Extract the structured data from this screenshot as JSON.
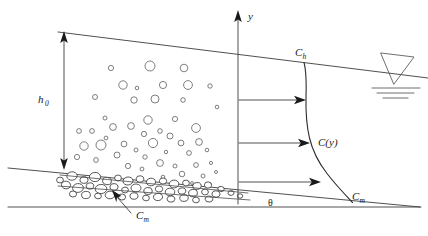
{
  "figure": {
    "kind": "schematic-diagram",
    "background_color": "#ffffff",
    "line_color": "#3c3c3c",
    "label_color": "#1a1a1a"
  },
  "labels": {
    "y_axis": "y",
    "flow_depth": "h",
    "flow_depth_sub": "0",
    "surface_concentration": "C",
    "surface_concentration_sub": "h",
    "profile": "C(y)",
    "max_concentration": "C",
    "max_concentration_sub": "m",
    "bed_concentration": "C",
    "bed_concentration_sub": "m",
    "slope_angle": "θ"
  },
  "geometry": {
    "water_surface": {
      "x1": 58,
      "y1": 32,
      "x2": 428,
      "y2": 78
    },
    "bed_line": {
      "x1": 8,
      "y1": 168,
      "x2": 420,
      "y2": 207
    },
    "datum_line": {
      "x1": 8,
      "y1": 207,
      "x2": 421,
      "y2": 207
    },
    "y_axis": {
      "x": 238,
      "y_top": 12,
      "y_bottom": 204
    },
    "depth_dimension": {
      "x": 64,
      "y_top": 33,
      "y_bottom": 168
    },
    "profile_curve_top_x": 305,
    "profile_curve_bottom_x": 352
  },
  "flux_arrows": [
    {
      "y": 100,
      "x_start": 239,
      "x_end": 305
    },
    {
      "y": 143,
      "x_start": 239,
      "x_end": 309
    },
    {
      "y": 182,
      "x_start": 239,
      "x_end": 320
    }
  ],
  "annotation_pointer": {
    "from_x": 130,
    "from_y": 212,
    "to_x": 113,
    "to_y": 193
  },
  "free_surface_symbol": {
    "triangle": [
      [
        381,
        53
      ],
      [
        414,
        57
      ],
      [
        394,
        84
      ]
    ],
    "lines": [
      {
        "x1": 372,
        "y1": 88,
        "x2": 420,
        "y2": 88
      },
      {
        "x1": 377,
        "y1": 93,
        "x2": 414,
        "y2": 93
      },
      {
        "x1": 383,
        "y1": 98,
        "x2": 408,
        "y2": 98
      }
    ]
  },
  "suspended_particles": [
    {
      "cx": 111,
      "cy": 68,
      "r": 2.6
    },
    {
      "cx": 150,
      "cy": 66,
      "r": 5.0
    },
    {
      "cx": 184,
      "cy": 68,
      "r": 3.8
    },
    {
      "cx": 123,
      "cy": 85,
      "r": 4.2
    },
    {
      "cx": 137,
      "cy": 88,
      "r": 1.8
    },
    {
      "cx": 163,
      "cy": 85,
      "r": 3.6
    },
    {
      "cx": 188,
      "cy": 85,
      "r": 4.4
    },
    {
      "cx": 210,
      "cy": 86,
      "r": 2.2
    },
    {
      "cx": 95,
      "cy": 97,
      "r": 2.5
    },
    {
      "cx": 134,
      "cy": 100,
      "r": 3.2
    },
    {
      "cx": 155,
      "cy": 99,
      "r": 4.0
    },
    {
      "cx": 183,
      "cy": 100,
      "r": 2.3
    },
    {
      "cx": 217,
      "cy": 107,
      "r": 1.8
    },
    {
      "cx": 105,
      "cy": 118,
      "r": 2.0
    },
    {
      "cx": 148,
      "cy": 120,
      "r": 4.2
    },
    {
      "cx": 175,
      "cy": 119,
      "r": 2.6
    },
    {
      "cx": 79,
      "cy": 131,
      "r": 2.4
    },
    {
      "cx": 92,
      "cy": 131,
      "r": 2.4
    },
    {
      "cx": 113,
      "cy": 127,
      "r": 3.4
    },
    {
      "cx": 131,
      "cy": 126,
      "r": 3.4
    },
    {
      "cx": 160,
      "cy": 131,
      "r": 2.3
    },
    {
      "cx": 196,
      "cy": 128,
      "r": 4.4
    },
    {
      "cx": 106,
      "cy": 138,
      "r": 1.9
    },
    {
      "cx": 144,
      "cy": 134,
      "r": 2.6
    },
    {
      "cx": 170,
      "cy": 136,
      "r": 3.0
    },
    {
      "cx": 84,
      "cy": 146,
      "r": 4.2
    },
    {
      "cx": 101,
      "cy": 145,
      "r": 5.0
    },
    {
      "cx": 124,
      "cy": 144,
      "r": 2.9
    },
    {
      "cx": 153,
      "cy": 143,
      "r": 4.6
    },
    {
      "cx": 181,
      "cy": 143,
      "r": 2.9
    },
    {
      "cx": 199,
      "cy": 142,
      "r": 3.4
    },
    {
      "cx": 136,
      "cy": 150,
      "r": 2.0
    },
    {
      "cx": 166,
      "cy": 152,
      "r": 1.7
    },
    {
      "cx": 117,
      "cy": 155,
      "r": 3.0
    },
    {
      "cx": 145,
      "cy": 157,
      "r": 2.2
    },
    {
      "cx": 189,
      "cy": 153,
      "r": 2.4
    },
    {
      "cx": 77,
      "cy": 157,
      "r": 2.6
    },
    {
      "cx": 207,
      "cy": 150,
      "r": 1.8
    },
    {
      "cx": 96,
      "cy": 160,
      "r": 2.4
    },
    {
      "cx": 160,
      "cy": 163,
      "r": 3.4
    },
    {
      "cx": 175,
      "cy": 166,
      "r": 2.0
    },
    {
      "cx": 128,
      "cy": 166,
      "r": 2.6
    },
    {
      "cx": 196,
      "cy": 165,
      "r": 2.4
    },
    {
      "cx": 142,
      "cy": 169,
      "r": 1.9
    },
    {
      "cx": 211,
      "cy": 163,
      "r": 1.6
    },
    {
      "cx": 182,
      "cy": 174,
      "r": 2.8
    },
    {
      "cx": 203,
      "cy": 176,
      "r": 2.0
    },
    {
      "cx": 163,
      "cy": 177,
      "r": 1.8
    },
    {
      "cx": 216,
      "cy": 172,
      "r": 1.5
    },
    {
      "cx": 192,
      "cy": 183,
      "r": 1.4
    },
    {
      "cx": 210,
      "cy": 184,
      "r": 1.3
    }
  ],
  "bed_particles": [
    {
      "cx": 72,
      "cy": 176,
      "rx": 5.2,
      "ry": 4.2,
      "rot": -5
    },
    {
      "cx": 84,
      "cy": 180,
      "rx": 4.0,
      "ry": 3.4,
      "rot": 8
    },
    {
      "cx": 95,
      "cy": 177,
      "rx": 5.6,
      "ry": 4.6,
      "rot": -3
    },
    {
      "cx": 107,
      "cy": 181,
      "rx": 4.4,
      "ry": 3.6,
      "rot": 12
    },
    {
      "cx": 118,
      "cy": 178,
      "rx": 3.4,
      "ry": 3.0,
      "rot": 0
    },
    {
      "cx": 128,
      "cy": 181,
      "rx": 5.0,
      "ry": 4.0,
      "rot": -8
    },
    {
      "cx": 140,
      "cy": 179,
      "rx": 3.8,
      "ry": 3.2,
      "rot": 5
    },
    {
      "cx": 151,
      "cy": 182,
      "rx": 4.6,
      "ry": 3.8,
      "rot": -6
    },
    {
      "cx": 163,
      "cy": 181,
      "rx": 3.6,
      "ry": 3.0,
      "rot": 10
    },
    {
      "cx": 174,
      "cy": 184,
      "rx": 4.8,
      "ry": 3.9,
      "rot": -4
    },
    {
      "cx": 186,
      "cy": 183,
      "rx": 3.4,
      "ry": 2.9,
      "rot": 6
    },
    {
      "cx": 197,
      "cy": 186,
      "rx": 4.2,
      "ry": 3.4,
      "rot": -9
    },
    {
      "cx": 208,
      "cy": 185,
      "rx": 3.6,
      "ry": 3.1,
      "rot": 3
    },
    {
      "cx": 66,
      "cy": 185,
      "rx": 4.6,
      "ry": 3.8,
      "rot": 7
    },
    {
      "cx": 78,
      "cy": 188,
      "rx": 5.4,
      "ry": 4.4,
      "rot": -6
    },
    {
      "cx": 90,
      "cy": 186,
      "rx": 3.8,
      "ry": 3.2,
      "rot": 4
    },
    {
      "cx": 101,
      "cy": 189,
      "rx": 5.8,
      "ry": 4.6,
      "rot": -2
    },
    {
      "cx": 114,
      "cy": 187,
      "rx": 4.0,
      "ry": 3.4,
      "rot": 9
    },
    {
      "cx": 125,
      "cy": 190,
      "rx": 3.4,
      "ry": 2.9,
      "rot": -5
    },
    {
      "cx": 136,
      "cy": 188,
      "rx": 5.0,
      "ry": 4.0,
      "rot": 2
    },
    {
      "cx": 148,
      "cy": 191,
      "rx": 4.2,
      "ry": 3.5,
      "rot": -7
    },
    {
      "cx": 159,
      "cy": 189,
      "rx": 3.6,
      "ry": 3.0,
      "rot": 11
    },
    {
      "cx": 170,
      "cy": 192,
      "rx": 4.8,
      "ry": 3.8,
      "rot": -3
    },
    {
      "cx": 182,
      "cy": 191,
      "rx": 3.8,
      "ry": 3.2,
      "rot": 5
    },
    {
      "cx": 193,
      "cy": 193,
      "rx": 4.4,
      "ry": 3.6,
      "rot": -8
    },
    {
      "cx": 205,
      "cy": 192,
      "rx": 3.4,
      "ry": 2.9,
      "rot": 2
    },
    {
      "cx": 216,
      "cy": 194,
      "rx": 4.0,
      "ry": 3.2,
      "rot": -6
    },
    {
      "cx": 73,
      "cy": 194,
      "rx": 3.6,
      "ry": 3.0,
      "rot": 4
    },
    {
      "cx": 86,
      "cy": 195,
      "rx": 4.4,
      "ry": 3.6,
      "rot": -5
    },
    {
      "cx": 98,
      "cy": 196,
      "rx": 3.4,
      "ry": 2.8,
      "rot": 8
    },
    {
      "cx": 110,
      "cy": 195,
      "rx": 4.8,
      "ry": 3.8,
      "rot": -4
    },
    {
      "cx": 122,
      "cy": 197,
      "rx": 3.6,
      "ry": 3.0,
      "rot": 6
    },
    {
      "cx": 134,
      "cy": 196,
      "rx": 4.0,
      "ry": 3.3,
      "rot": -7
    },
    {
      "cx": 146,
      "cy": 198,
      "rx": 3.4,
      "ry": 2.8,
      "rot": 3
    },
    {
      "cx": 158,
      "cy": 197,
      "rx": 4.6,
      "ry": 3.6,
      "rot": -5
    },
    {
      "cx": 171,
      "cy": 199,
      "rx": 3.8,
      "ry": 3.1,
      "rot": 7
    },
    {
      "cx": 184,
      "cy": 198,
      "rx": 4.2,
      "ry": 3.4,
      "rot": -3
    },
    {
      "cx": 196,
      "cy": 200,
      "rx": 3.4,
      "ry": 2.8,
      "rot": 5
    },
    {
      "cx": 209,
      "cy": 199,
      "rx": 3.8,
      "ry": 3.0,
      "rot": -6
    },
    {
      "cx": 60,
      "cy": 180,
      "rx": 3.4,
      "ry": 2.9,
      "rot": 0
    },
    {
      "cx": 221,
      "cy": 189,
      "rx": 3.2,
      "ry": 2.6,
      "rot": 4
    },
    {
      "cx": 231,
      "cy": 193,
      "rx": 3.0,
      "ry": 2.4,
      "rot": -4
    },
    {
      "cx": 240,
      "cy": 196,
      "rx": 2.8,
      "ry": 2.2,
      "rot": 3
    }
  ]
}
